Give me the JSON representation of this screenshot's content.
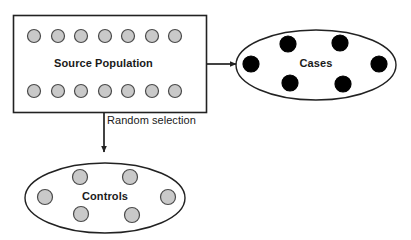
{
  "diagram": {
    "background_color": "#ffffff",
    "stroke_color": "#222222",
    "nodes": {
      "source_population": {
        "label": "Source Population",
        "shape": "rectangle",
        "x": 13,
        "y": 15,
        "width": 194,
        "height": 98,
        "fill": "#ffffff",
        "stroke": "#222222",
        "members": {
          "marker_shape": "circle",
          "marker_fill": "#c9c9c9",
          "marker_stroke": "#4a4a4a",
          "marker_diameter": 13,
          "rows": [
            {
              "row_name": "top-row",
              "count": 7,
              "cy": 36,
              "cx_positions": [
                34,
                58,
                81,
                105,
                128,
                152,
                175
              ]
            },
            {
              "row_name": "bottom-row",
              "count": 7,
              "cy": 91,
              "cx_positions": [
                34,
                58,
                81,
                105,
                128,
                152,
                175
              ]
            }
          ]
        }
      },
      "cases": {
        "label": "Cases",
        "shape": "ellipse",
        "cx": 316,
        "cy": 65,
        "rx": 80,
        "ry": 35,
        "fill": "#ffffff",
        "stroke": "#222222",
        "members": {
          "marker_shape": "circle",
          "marker_fill": "#000000",
          "marker_stroke": "#000000",
          "marker_diameter": 16,
          "count": 6,
          "points": [
            {
              "cx": 251,
              "cy": 64
            },
            {
              "cx": 288,
              "cy": 44
            },
            {
              "cx": 340,
              "cy": 43
            },
            {
              "cx": 379,
              "cy": 64
            },
            {
              "cx": 290,
              "cy": 83
            },
            {
              "cx": 343,
              "cy": 84
            }
          ]
        }
      },
      "controls": {
        "label": "Controls",
        "shape": "ellipse",
        "cx": 105,
        "cy": 198,
        "rx": 80,
        "ry": 35,
        "fill": "#ffffff",
        "stroke": "#222222",
        "members": {
          "marker_shape": "circle",
          "marker_fill": "#c9c9c9",
          "marker_stroke": "#4a4a4a",
          "marker_diameter": 15,
          "count": 6,
          "points": [
            {
              "cx": 45,
              "cy": 197
            },
            {
              "cx": 80,
              "cy": 177
            },
            {
              "cx": 130,
              "cy": 177
            },
            {
              "cx": 168,
              "cy": 197
            },
            {
              "cx": 81,
              "cy": 214
            },
            {
              "cx": 132,
              "cy": 215
            }
          ]
        }
      }
    },
    "edges": [
      {
        "edge_name": "source-to-cases",
        "label": "",
        "direction": "right",
        "from": {
          "x": 207,
          "y": 64
        },
        "to": {
          "x": 236,
          "y": 64
        },
        "stroke": "#222222"
      },
      {
        "edge_name": "source-to-controls",
        "label": "Random selection",
        "direction": "down",
        "from": {
          "x": 104,
          "y": 113
        },
        "to": {
          "x": 104,
          "y": 152
        },
        "stroke": "#222222",
        "label_x": 107,
        "label_y": 115
      }
    ]
  }
}
